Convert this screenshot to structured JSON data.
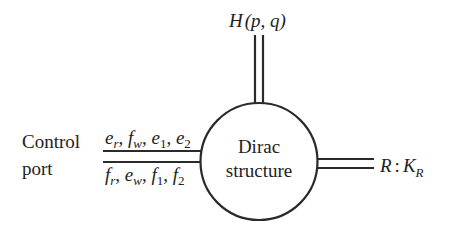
{
  "diagram": {
    "center_node": {
      "line1": "Dirac",
      "line2": "structure"
    },
    "top_port": {
      "label_main": "H",
      "label_args": "(p, q)"
    },
    "right_port": {
      "label_R": "R",
      "label_colon": ":",
      "label_K": "K",
      "label_K_sub": "R"
    },
    "left_port": {
      "title_line1": "Control",
      "title_line2": "port",
      "upper_signals": [
        {
          "sym": "e",
          "sub": "r"
        },
        {
          "sym": "f",
          "sub": "w"
        },
        {
          "sym": "e",
          "sub": "1"
        },
        {
          "sym": "e",
          "sub": "2"
        }
      ],
      "lower_signals": [
        {
          "sym": "f",
          "sub": "r"
        },
        {
          "sym": "e",
          "sub": "w"
        },
        {
          "sym": "f",
          "sub": "1"
        },
        {
          "sym": "f",
          "sub": "2"
        }
      ],
      "separator": ", "
    },
    "colors": {
      "stroke": "#2a2a2a",
      "text": "#222222",
      "background": "#ffffff"
    }
  }
}
